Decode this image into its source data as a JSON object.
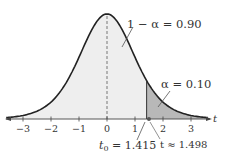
{
  "chart_data": {
    "type": "area",
    "title": "",
    "xlabel": "t",
    "ylabel": "",
    "x_ticks": [
      -3,
      -2,
      -1,
      0,
      1,
      2,
      3
    ],
    "tick_labels": [
      "−3",
      "−2",
      "−1",
      "0",
      "1",
      "2",
      "3"
    ],
    "xlim": [
      -3.6,
      3.6
    ],
    "distribution": "t (bell-shaped density)",
    "mean": 0,
    "critical_value": 1.415,
    "test_statistic": 1.498,
    "regions": [
      {
        "name": "non-rejection",
        "from": -3.6,
        "to": 1.415,
        "area": 0.9,
        "label": "1 − α = 0.90"
      },
      {
        "name": "rejection",
        "from": 1.415,
        "to": 3.6,
        "area": 0.1,
        "label": "α = 0.10"
      }
    ],
    "annotations": [
      {
        "text": "1 − α = 0.90",
        "points_to": "central region"
      },
      {
        "text": "α = 0.10",
        "points_to": "right tail"
      },
      {
        "text": "t₀ = 1.415",
        "points_to": "critical value"
      },
      {
        "text": "t ≈ 1.498",
        "points_to": "test statistic point"
      }
    ],
    "grid": false,
    "legend": "none",
    "colors": {
      "curve": "#222222",
      "body_fill": "#eeeeee",
      "tail_fill": "#b8b8b8",
      "axis": "#444444",
      "dashed_mean": "#777777"
    }
  },
  "labels": {
    "axis_var": "t",
    "center_area": "1 − α = 0.90",
    "tail_area": "α = 0.10",
    "t0_prefix": "t",
    "t0_sub": "0",
    "t0_value": " = 1.415",
    "t_stat": "t ≈ 1.498"
  }
}
